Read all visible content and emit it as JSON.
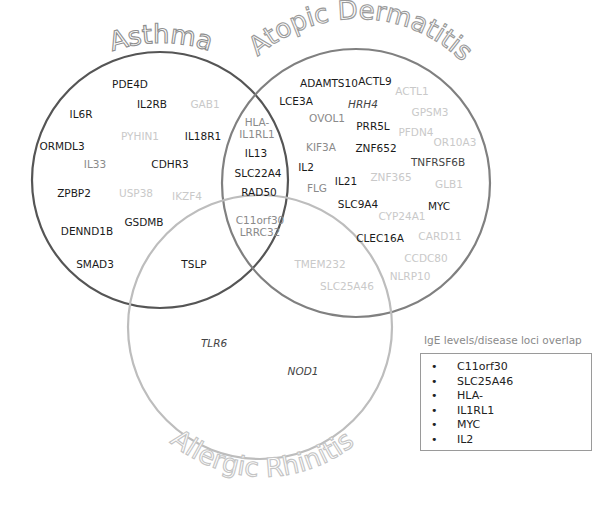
{
  "circles": {
    "asthma": {
      "label": "Asthma",
      "cx": 160,
      "cy": 180,
      "r": 128,
      "stroke": "#555555"
    },
    "atopic_dermatitis": {
      "label": "Atopic Dermatitis",
      "cx": 356,
      "cy": 183,
      "r": 134,
      "stroke": "#808080"
    },
    "allergic_rhinitis": {
      "label": "Allergic Rhinitis",
      "cx": 260,
      "cy": 327,
      "r": 132,
      "stroke": "#bdbdbd"
    }
  },
  "genes": [
    {
      "name": "PDE4D",
      "x": 130,
      "y": 84,
      "shade": "black"
    },
    {
      "name": "IL2RB",
      "x": 152,
      "y": 104,
      "shade": "black"
    },
    {
      "name": "GAB1",
      "x": 205,
      "y": 104,
      "shade": "light"
    },
    {
      "name": "IL6R",
      "x": 81,
      "y": 114,
      "shade": "black"
    },
    {
      "name": "PYHIN1",
      "x": 140,
      "y": 136,
      "shade": "light"
    },
    {
      "name": "IL18R1",
      "x": 203,
      "y": 136,
      "shade": "black"
    },
    {
      "name": "ORMDL3",
      "x": 62,
      "y": 146,
      "shade": "black"
    },
    {
      "name": "IL33",
      "x": 95,
      "y": 164,
      "shade": "mid"
    },
    {
      "name": "CDHR3",
      "x": 170,
      "y": 164,
      "shade": "black"
    },
    {
      "name": "ZPBP2",
      "x": 74,
      "y": 193,
      "shade": "black"
    },
    {
      "name": "USP38",
      "x": 136,
      "y": 193,
      "shade": "light"
    },
    {
      "name": "IKZF4",
      "x": 187,
      "y": 196,
      "shade": "light"
    },
    {
      "name": "GSDMB",
      "x": 144,
      "y": 222,
      "shade": "black"
    },
    {
      "name": "DENND1B",
      "x": 87,
      "y": 231,
      "shade": "black"
    },
    {
      "name": "SMAD3",
      "x": 95,
      "y": 264,
      "shade": "black"
    },
    {
      "name": "TSLP",
      "x": 194,
      "y": 264,
      "shade": "black"
    },
    {
      "name": "HLA-\nIL1RL1",
      "x": 257,
      "y": 128,
      "shade": "mid"
    },
    {
      "name": "IL13",
      "x": 256,
      "y": 153,
      "shade": "black"
    },
    {
      "name": "SLC22A4",
      "x": 258,
      "y": 173,
      "shade": "black"
    },
    {
      "name": "RAD50",
      "x": 259,
      "y": 192,
      "shade": "black"
    },
    {
      "name": "C11orf30\nLRRC32",
      "x": 260,
      "y": 226,
      "shade": "mid"
    },
    {
      "name": "ADAMTS10",
      "x": 329,
      "y": 83,
      "shade": "black"
    },
    {
      "name": "ACTL9",
      "x": 375,
      "y": 81,
      "shade": "black"
    },
    {
      "name": "LCE3A",
      "x": 296,
      "y": 101,
      "shade": "black"
    },
    {
      "name": "ACTL1",
      "x": 412,
      "y": 91,
      "shade": "light"
    },
    {
      "name": "HRH4",
      "x": 363,
      "y": 104,
      "shade": "dark",
      "italic": true
    },
    {
      "name": "OVOL1",
      "x": 327,
      "y": 118,
      "shade": "mid"
    },
    {
      "name": "GPSM3",
      "x": 430,
      "y": 112,
      "shade": "light"
    },
    {
      "name": "PRR5L",
      "x": 373,
      "y": 126,
      "shade": "black"
    },
    {
      "name": "PFDN4",
      "x": 416,
      "y": 132,
      "shade": "light"
    },
    {
      "name": "KIF3A",
      "x": 321,
      "y": 147,
      "shade": "mid"
    },
    {
      "name": "ZNF652",
      "x": 376,
      "y": 148,
      "shade": "black"
    },
    {
      "name": "OR10A3",
      "x": 455,
      "y": 142,
      "shade": "light"
    },
    {
      "name": "TNFRSF6B",
      "x": 438,
      "y": 162,
      "shade": "dark"
    },
    {
      "name": "IL2",
      "x": 306,
      "y": 167,
      "shade": "black"
    },
    {
      "name": "FLG",
      "x": 317,
      "y": 188,
      "shade": "mid"
    },
    {
      "name": "IL21",
      "x": 346,
      "y": 181,
      "shade": "black"
    },
    {
      "name": "ZNF365",
      "x": 391,
      "y": 177,
      "shade": "light"
    },
    {
      "name": "GLB1",
      "x": 449,
      "y": 184,
      "shade": "light"
    },
    {
      "name": "SLC9A4",
      "x": 358,
      "y": 204,
      "shade": "black"
    },
    {
      "name": "MYC",
      "x": 439,
      "y": 206,
      "shade": "black"
    },
    {
      "name": "CYP24A1",
      "x": 402,
      "y": 216,
      "shade": "light"
    },
    {
      "name": "CLEC16A",
      "x": 380,
      "y": 238,
      "shade": "black"
    },
    {
      "name": "CARD11",
      "x": 440,
      "y": 236,
      "shade": "light"
    },
    {
      "name": "TMEM232",
      "x": 320,
      "y": 264,
      "shade": "light"
    },
    {
      "name": "CCDC80",
      "x": 426,
      "y": 258,
      "shade": "light"
    },
    {
      "name": "NLRP10",
      "x": 410,
      "y": 276,
      "shade": "light"
    },
    {
      "name": "SLC25A46",
      "x": 347,
      "y": 286,
      "shade": "light"
    },
    {
      "name": "TLR6",
      "x": 214,
      "y": 343,
      "shade": "dark",
      "italic": true
    },
    {
      "name": "NOD1",
      "x": 303,
      "y": 371,
      "shade": "dark",
      "italic": true
    }
  ],
  "legend": {
    "title": "IgE levels/disease loci overlap",
    "bullet": "•",
    "items": [
      "C11orf30",
      "SLC25A46",
      "HLA-",
      "IL1RL1",
      "MYC",
      "IL2"
    ]
  }
}
